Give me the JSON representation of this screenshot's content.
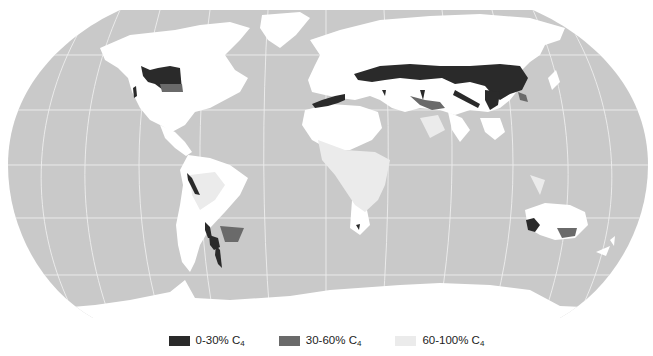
{
  "map": {
    "projection": "Robinson",
    "ocean_color": "#c9c9c9",
    "graticule_color": "#f2f2f2",
    "land_low_c4_color": "#ffffff",
    "classes": [
      {
        "id": "c4-0-30",
        "label": "0-30% C",
        "subscript": "4",
        "color": "#2a2a2a"
      },
      {
        "id": "c4-30-60",
        "label": "30-60% C",
        "subscript": "4",
        "color": "#6a6a6a"
      },
      {
        "id": "c4-60-100",
        "label": "60-100% C",
        "subscript": "4",
        "color": "#ebebeb"
      }
    ]
  },
  "legend": {
    "items": [
      {
        "label": "0-30% C",
        "sub": "4"
      },
      {
        "label": "30-60% C",
        "sub": "4"
      },
      {
        "label": "60-100% C",
        "sub": "4"
      }
    ]
  }
}
